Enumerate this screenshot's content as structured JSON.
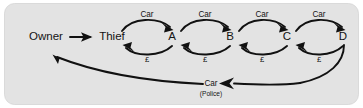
{
  "figure": {
    "panel": {
      "fill_color": "#e3e3e3",
      "border_color": "#d2d2d2",
      "corner_radius": "10"
    },
    "ink_color": "#111111"
  },
  "nodes": [
    {
      "id": "owner",
      "label": "Owner",
      "x": 46,
      "y": 37
    },
    {
      "id": "thief",
      "label": "Thief",
      "x": 112,
      "y": 37
    },
    {
      "id": "a",
      "label": "A",
      "x": 172,
      "y": 37
    },
    {
      "id": "b",
      "label": "B",
      "x": 230,
      "y": 37
    },
    {
      "id": "c",
      "label": "C",
      "x": 287,
      "y": 37
    },
    {
      "id": "d",
      "label": "D",
      "x": 343,
      "y": 37
    }
  ],
  "edges": {
    "theft": {
      "from": "owner",
      "to": "thief",
      "label": ""
    },
    "car_forward": [
      {
        "from": "thief",
        "to": "a",
        "label": "Car"
      },
      {
        "from": "a",
        "to": "b",
        "label": "Car"
      },
      {
        "from": "b",
        "to": "c",
        "label": "Car"
      },
      {
        "from": "c",
        "to": "d",
        "label": "Car"
      }
    ],
    "money_back": [
      {
        "from": "a",
        "to": "thief",
        "label": "£"
      },
      {
        "from": "b",
        "to": "a",
        "label": "£"
      },
      {
        "from": "c",
        "to": "b",
        "label": "£"
      },
      {
        "from": "d",
        "to": "c",
        "label": "£"
      }
    ],
    "recovery": {
      "from": "d",
      "to": "owner",
      "label": "Car",
      "sublabel": "(Police)"
    }
  }
}
